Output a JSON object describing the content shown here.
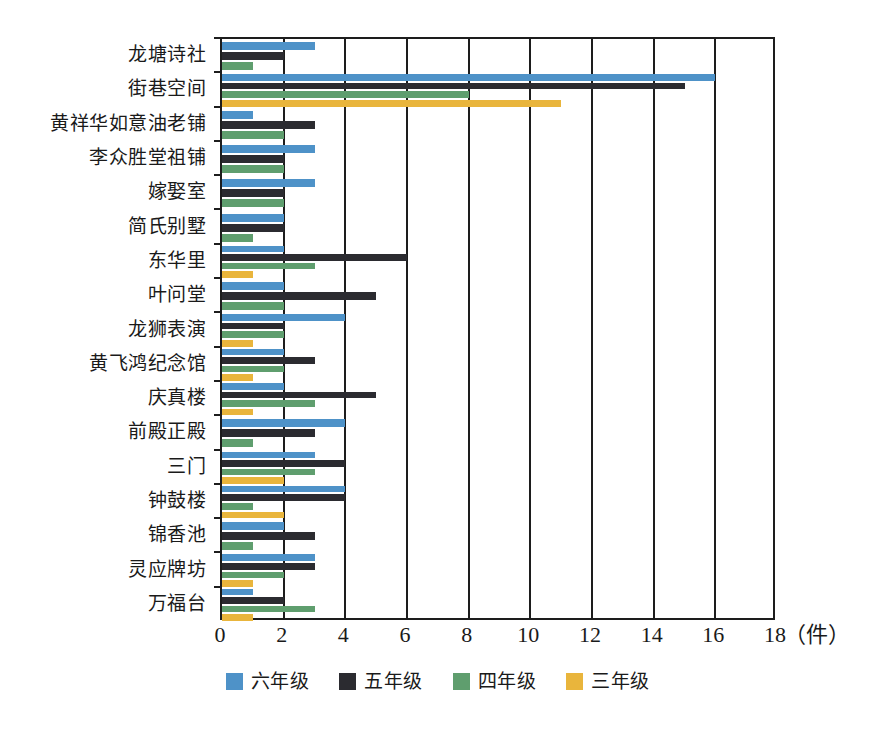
{
  "chart_data": {
    "type": "bar",
    "orientation": "horizontal",
    "title": "",
    "xlabel": "（件）",
    "ylabel": "",
    "xlim": [
      0,
      18
    ],
    "xticks": [
      "0",
      "2",
      "4",
      "6",
      "8",
      "10",
      "12",
      "14",
      "16",
      "18"
    ],
    "xtick_values": [
      0,
      2,
      4,
      6,
      8,
      10,
      12,
      14,
      16,
      18
    ],
    "grid": true,
    "legend_position": "bottom",
    "categories": [
      "龙塘诗社",
      "街巷空间",
      "黄祥华如意油老铺",
      "李众胜堂祖铺",
      "嫁娶室",
      "简氏别墅",
      "东华里",
      "叶问堂",
      "龙狮表演",
      "黄飞鸿纪念馆",
      "庆真楼",
      "前殿正殿",
      "三门",
      "钟鼓楼",
      "锦香池",
      "灵应牌坊",
      "万福台"
    ],
    "series": [
      {
        "name": "六年级",
        "color": "#4e92c8",
        "values": [
          3,
          16,
          1,
          3,
          3,
          2,
          2,
          2,
          4,
          2,
          2,
          4,
          3,
          4,
          2,
          3,
          1
        ]
      },
      {
        "name": "五年级",
        "color": "#2b2b30",
        "values": [
          2,
          15,
          3,
          2,
          2,
          2,
          6,
          5,
          2,
          3,
          5,
          3,
          4,
          4,
          3,
          3,
          2
        ]
      },
      {
        "name": "四年级",
        "color": "#5f9e6e",
        "values": [
          1,
          8,
          2,
          2,
          2,
          1,
          3,
          2,
          2,
          2,
          3,
          1,
          3,
          1,
          1,
          2,
          3
        ]
      },
      {
        "name": "三年级",
        "color": "#e9b53c",
        "values": [
          0,
          11,
          0,
          0,
          0,
          0,
          1,
          0,
          1,
          1,
          1,
          0,
          2,
          2,
          0,
          1,
          1
        ]
      }
    ]
  },
  "axis": {
    "unit_label": "（件）"
  }
}
